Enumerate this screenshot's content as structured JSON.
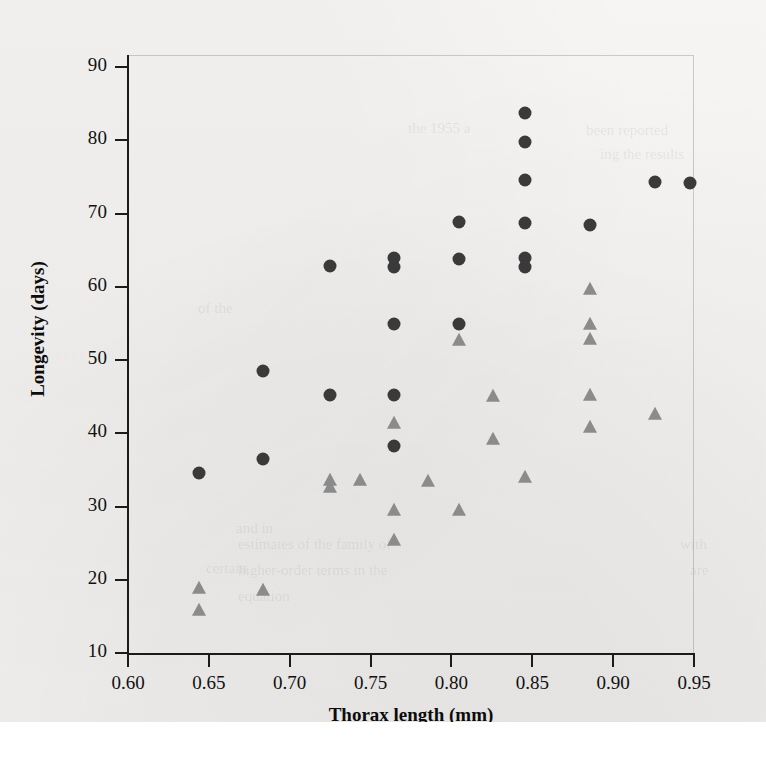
{
  "chart_data": {
    "type": "scatter",
    "title": "",
    "xlabel": "Thorax length (mm)",
    "ylabel": "Longevity (days)",
    "xlim": [
      0.6,
      0.95
    ],
    "ylim": [
      10,
      90
    ],
    "xticks": [
      "0.60",
      "0.65",
      "0.70",
      "0.75",
      "0.80",
      "0.85",
      "0.90",
      "0.95"
    ],
    "xtick_values": [
      0.6,
      0.65,
      0.7,
      0.75,
      0.8,
      0.85,
      0.9,
      0.95
    ],
    "yticks": [
      "90",
      "80",
      "70",
      "60",
      "50",
      "40",
      "30",
      "20",
      "10"
    ],
    "ytick_values": [
      90,
      80,
      70,
      60,
      50,
      40,
      30,
      20,
      10
    ],
    "grid": false,
    "legend": "none",
    "series": [
      {
        "name": "circles",
        "marker": "circle",
        "color": "#3a3a3a",
        "points": [
          [
            0.643,
            34.7
          ],
          [
            0.683,
            48.6
          ],
          [
            0.683,
            36.6
          ],
          [
            0.724,
            63.0
          ],
          [
            0.724,
            45.4
          ],
          [
            0.764,
            64.0
          ],
          [
            0.764,
            62.8
          ],
          [
            0.764,
            55.1
          ],
          [
            0.764,
            45.3
          ],
          [
            0.764,
            38.4
          ],
          [
            0.804,
            69.0
          ],
          [
            0.804,
            63.9
          ],
          [
            0.804,
            55.1
          ],
          [
            0.845,
            83.9
          ],
          [
            0.845,
            79.9
          ],
          [
            0.845,
            74.7
          ],
          [
            0.845,
            68.8
          ],
          [
            0.845,
            64.1
          ],
          [
            0.845,
            62.8
          ],
          [
            0.885,
            68.6
          ],
          [
            0.925,
            74.4
          ],
          [
            0.947,
            74.3
          ]
        ]
      },
      {
        "name": "triangles",
        "marker": "triangle",
        "color": "#8b8b8b",
        "points": [
          [
            0.643,
            19.0
          ],
          [
            0.643,
            16.0
          ],
          [
            0.683,
            18.8
          ],
          [
            0.724,
            33.8
          ],
          [
            0.724,
            32.8
          ],
          [
            0.743,
            33.7
          ],
          [
            0.764,
            41.6
          ],
          [
            0.764,
            29.7
          ],
          [
            0.764,
            25.5
          ],
          [
            0.785,
            33.6
          ],
          [
            0.804,
            52.9
          ],
          [
            0.804,
            29.6
          ],
          [
            0.825,
            45.2
          ],
          [
            0.825,
            39.3
          ],
          [
            0.845,
            34.2
          ],
          [
            0.885,
            59.8
          ],
          [
            0.885,
            55.0
          ],
          [
            0.885,
            53.0
          ],
          [
            0.885,
            45.3
          ],
          [
            0.885,
            41.0
          ],
          [
            0.925,
            42.8
          ]
        ]
      }
    ]
  },
  "colors": {
    "circle": "#3a3a3a",
    "triangle": "#8b8b8b",
    "axis": "#1b1b1b",
    "page_background": "#f4f3f1"
  },
  "ghost_text": [
    {
      "text": "the 1955 a",
      "x": 408,
      "y": 120
    },
    {
      "text": "been reported",
      "x": 586,
      "y": 122
    },
    {
      "text": "ing the results",
      "x": 600,
      "y": 146
    },
    {
      "text": "of the",
      "x": 198,
      "y": 300
    },
    {
      "text": "and in",
      "x": 236,
      "y": 520
    },
    {
      "text": "certain",
      "x": 206,
      "y": 560
    },
    {
      "text": "estimates of the family of",
      "x": 238,
      "y": 536
    },
    {
      "text": "higher-order terms in the",
      "x": 238,
      "y": 562
    },
    {
      "text": "equation",
      "x": 238,
      "y": 588
    },
    {
      "text": "with",
      "x": 680,
      "y": 536
    },
    {
      "text": "are",
      "x": 690,
      "y": 562
    }
  ]
}
